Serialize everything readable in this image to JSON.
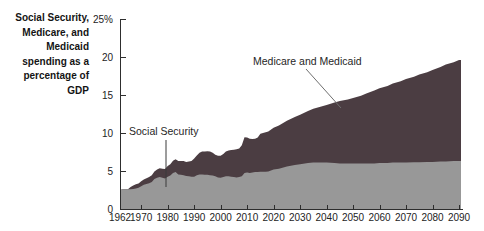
{
  "figure": {
    "background": "#ffffff",
    "axis_color": "#2e2e2e",
    "text_color": "#232323"
  },
  "chart_data": {
    "type": "area",
    "stacked": true,
    "axis_title": "Social Security,\nMedicare, and\nMedicaid\nspending as a\npercentage of\nGDP",
    "xlabel": "",
    "ylabel_unit": "% of GDP",
    "ylim": [
      0,
      25
    ],
    "xlim": [
      1962,
      2090
    ],
    "grid": false,
    "legend": "inline-annotations",
    "y_ticks": [
      {
        "v": 0,
        "label": "0"
      },
      {
        "v": 5,
        "label": "5"
      },
      {
        "v": 10,
        "label": "10"
      },
      {
        "v": 15,
        "label": "15"
      },
      {
        "v": 20,
        "label": "20"
      },
      {
        "v": 25,
        "label": "25%"
      }
    ],
    "x_ticks": [
      1962,
      1970,
      1980,
      1990,
      2000,
      2010,
      2020,
      2030,
      2040,
      2050,
      2060,
      2070,
      2080,
      2090
    ],
    "x": [
      1962,
      1963,
      1964,
      1965,
      1966,
      1967,
      1968,
      1969,
      1970,
      1971,
      1972,
      1973,
      1974,
      1975,
      1976,
      1977,
      1978,
      1979,
      1980,
      1981,
      1982,
      1983,
      1984,
      1985,
      1986,
      1987,
      1988,
      1989,
      1990,
      1991,
      1992,
      1993,
      1994,
      1995,
      1996,
      1997,
      1998,
      1999,
      2000,
      2001,
      2002,
      2003,
      2004,
      2005,
      2006,
      2007,
      2008,
      2009,
      2010,
      2011,
      2012,
      2013,
      2014,
      2015,
      2016,
      2017,
      2018,
      2020,
      2022,
      2025,
      2028,
      2030,
      2033,
      2035,
      2038,
      2040,
      2043,
      2045,
      2048,
      2050,
      2053,
      2055,
      2058,
      2060,
      2063,
      2065,
      2068,
      2070,
      2073,
      2075,
      2078,
      2080,
      2083,
      2085,
      2088,
      2090
    ],
    "series": [
      {
        "name": "Social Security",
        "color": "#989898",
        "values": [
          2.5,
          2.6,
          2.6,
          2.6,
          2.6,
          2.65,
          2.7,
          2.8,
          3.0,
          3.2,
          3.3,
          3.4,
          3.55,
          3.95,
          4.1,
          4.2,
          4.1,
          4.0,
          4.25,
          4.4,
          4.75,
          4.85,
          4.55,
          4.5,
          4.45,
          4.35,
          4.3,
          4.25,
          4.25,
          4.45,
          4.55,
          4.55,
          4.5,
          4.5,
          4.45,
          4.4,
          4.3,
          4.15,
          4.1,
          4.2,
          4.3,
          4.3,
          4.25,
          4.2,
          4.15,
          4.2,
          4.3,
          4.75,
          4.8,
          4.75,
          4.8,
          4.85,
          4.85,
          4.9,
          4.9,
          4.9,
          4.95,
          5.2,
          5.3,
          5.6,
          5.8,
          5.9,
          6.05,
          6.1,
          6.1,
          6.1,
          6.05,
          6.0,
          6.0,
          6.0,
          6.0,
          6.0,
          6.0,
          6.05,
          6.05,
          6.1,
          6.1,
          6.1,
          6.15,
          6.15,
          6.2,
          6.2,
          6.25,
          6.25,
          6.3,
          6.3
        ]
      },
      {
        "name": "Medicare and Medicaid",
        "color": "#4b3d42",
        "values": [
          0,
          0,
          0,
          0,
          0.3,
          0.45,
          0.55,
          0.55,
          0.65,
          0.7,
          0.75,
          0.8,
          0.9,
          1.0,
          1.1,
          1.15,
          1.2,
          1.25,
          1.4,
          1.5,
          1.6,
          1.7,
          1.75,
          1.8,
          1.85,
          1.85,
          1.95,
          2.05,
          2.4,
          2.6,
          2.85,
          3.0,
          3.05,
          3.1,
          3.1,
          3.0,
          2.85,
          2.85,
          2.9,
          3.05,
          3.25,
          3.4,
          3.5,
          3.6,
          3.7,
          3.75,
          4.1,
          4.7,
          4.6,
          4.5,
          4.4,
          4.4,
          4.55,
          5.0,
          5.1,
          5.2,
          5.25,
          5.5,
          5.7,
          6.0,
          6.3,
          6.5,
          6.85,
          7.1,
          7.4,
          7.6,
          7.95,
          8.2,
          8.4,
          8.6,
          8.9,
          9.2,
          9.6,
          9.85,
          10.15,
          10.4,
          10.7,
          11.0,
          11.25,
          11.55,
          11.8,
          12.1,
          12.45,
          12.75,
          13.0,
          13.3
        ]
      }
    ],
    "annotations": [
      {
        "label": "Social Security",
        "target_year": 1980
      },
      {
        "label": "Medicare and Medicaid",
        "target_year": 2046
      }
    ]
  }
}
